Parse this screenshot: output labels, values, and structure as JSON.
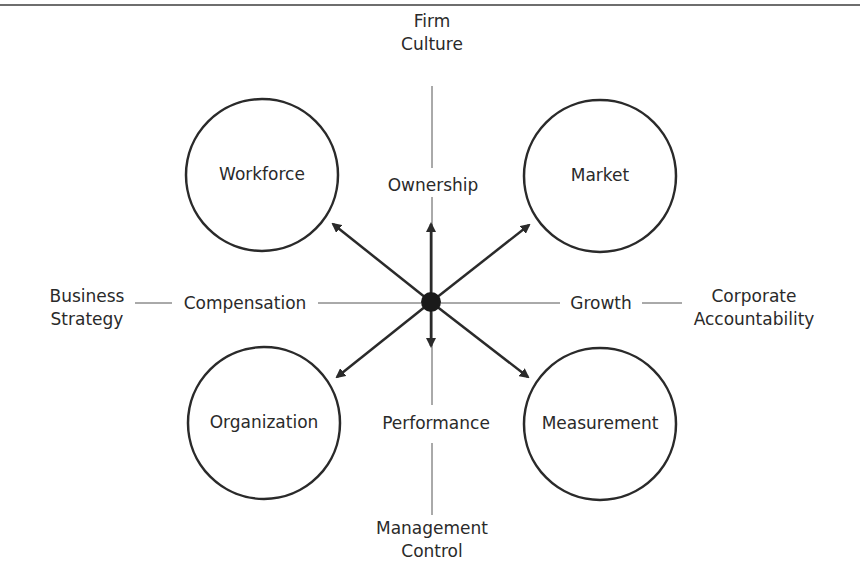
{
  "colors": {
    "background": "#ffffff",
    "ink": "#2a2a2a",
    "thin_line": "#555555",
    "border": "#6e6e6e"
  },
  "center": {
    "x": 431,
    "y": 302,
    "r": 10
  },
  "axes": {
    "top": {
      "lines": [
        "Firm",
        "Culture"
      ],
      "inner_label": "Ownership"
    },
    "bottom": {
      "lines": [
        "Management",
        "Control"
      ],
      "inner_label": "Performance"
    },
    "left": {
      "lines": [
        "Business",
        "Strategy"
      ],
      "inner_label": "Compensation"
    },
    "right": {
      "lines": [
        "Corporate",
        "Accountability"
      ],
      "inner_label": "Growth"
    }
  },
  "circles": [
    {
      "id": "workforce",
      "label": "Workforce",
      "cx": 262,
      "cy": 175,
      "r": 76
    },
    {
      "id": "market",
      "label": "Market",
      "cx": 600,
      "cy": 176,
      "r": 76
    },
    {
      "id": "organization",
      "label": "Organization",
      "cx": 264,
      "cy": 423,
      "r": 76
    },
    {
      "id": "measurement",
      "label": "Measurement",
      "cx": 600,
      "cy": 424,
      "r": 76
    }
  ],
  "arrows": [
    {
      "id": "to-workforce",
      "x2": 333,
      "y2": 224
    },
    {
      "id": "to-market",
      "x2": 529,
      "y2": 225
    },
    {
      "id": "to-organization",
      "x2": 337,
      "y2": 377
    },
    {
      "id": "to-measurement",
      "x2": 528,
      "y2": 377
    },
    {
      "id": "up-ownership",
      "x2": 431,
      "y2": 224
    },
    {
      "id": "down-performance",
      "x2": 431,
      "y2": 346
    }
  ]
}
